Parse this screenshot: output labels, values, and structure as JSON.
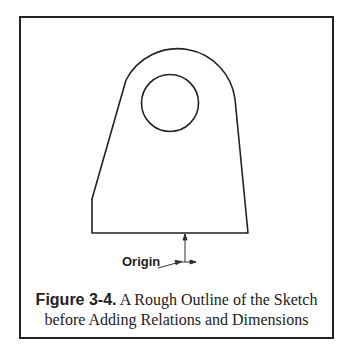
{
  "figure": {
    "label": "Figure 3-4.",
    "caption_line1": " A Rough Outline of the Sketch",
    "caption_line2": "before Adding Relations and Dimensions",
    "annotation": "Origin"
  },
  "colors": {
    "line": "#222222",
    "background": "#ffffff"
  }
}
